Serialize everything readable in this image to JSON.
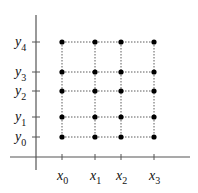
{
  "diagram": {
    "title": "",
    "axes": {
      "origin": [
        36,
        157
      ],
      "y_axis_top": 15,
      "y_axis_bottom": 170,
      "x_axis_left": 10,
      "x_axis_right": 190
    },
    "x_ticks": [
      {
        "name": "x",
        "sub": "0",
        "pos": 62
      },
      {
        "name": "x",
        "sub": "1",
        "pos": 95
      },
      {
        "name": "x",
        "sub": "2",
        "pos": 121
      },
      {
        "name": "x",
        "sub": "3",
        "pos": 154
      }
    ],
    "y_ticks": [
      {
        "name": "y",
        "sub": "0",
        "pos": 137
      },
      {
        "name": "y",
        "sub": "1",
        "pos": 117
      },
      {
        "name": "y",
        "sub": "2",
        "pos": 91
      },
      {
        "name": "y",
        "sub": "3",
        "pos": 72
      },
      {
        "name": "y",
        "sub": "4",
        "pos": 42
      }
    ],
    "grid": {
      "style": "dashed",
      "points": "all x_i × y_j intersections (4×5 = 20 nodes)"
    },
    "colors": {
      "axis": "#555555",
      "grid": "#333333",
      "node": "#000000",
      "text": "#111111"
    }
  }
}
